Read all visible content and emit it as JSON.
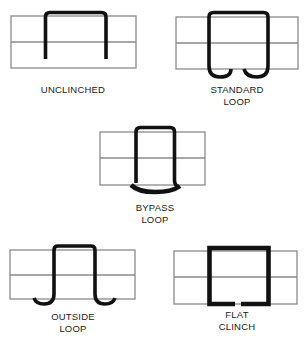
{
  "figure": {
    "panels": [
      {
        "id": "unclinched",
        "label_lines": [
          "UNCLINCHED"
        ]
      },
      {
        "id": "standard-loop",
        "label_lines": [
          "STANDARD",
          "LOOP"
        ]
      },
      {
        "id": "bypass-loop",
        "label_lines": [
          "BYPASS",
          "LOOP"
        ]
      },
      {
        "id": "outside-loop",
        "label_lines": [
          "OUTSIDE",
          "LOOP"
        ]
      },
      {
        "id": "flat-clinch",
        "label_lines": [
          "FLAT",
          "CLINCH"
        ]
      }
    ],
    "colors": {
      "board_lines": "#8a8a8a",
      "staple": "#111111",
      "background": "#ffffff"
    }
  }
}
